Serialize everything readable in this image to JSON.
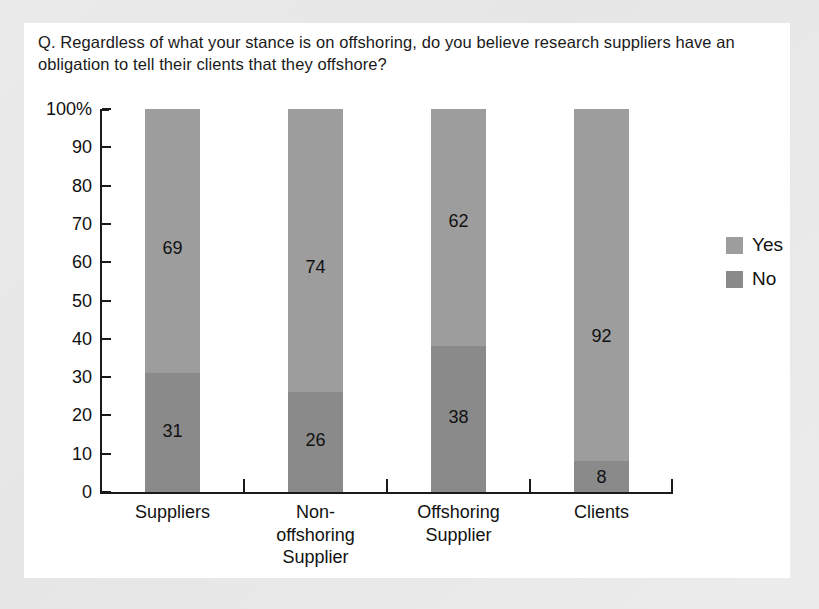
{
  "card": {
    "question": "Q. Regardless of what your stance is on offshoring, do you believe research suppliers have an obligation to tell their clients that they offshore?"
  },
  "legend": {
    "position": "right",
    "items": [
      {
        "label": "Yes",
        "color": "#9d9d9d",
        "swatch_name": "legend-swatch-yes"
      },
      {
        "label": "No",
        "color": "#8a8a8a",
        "swatch_name": "legend-swatch-no"
      }
    ]
  },
  "axis": {
    "y_ticks": [
      "100%",
      "90",
      "80",
      "70",
      "60",
      "50",
      "40",
      "30",
      "20",
      "10",
      "0"
    ],
    "x_categories": [
      "Suppliers",
      "Non-\noffshoring\nSupplier",
      "Offshoring\nSupplier",
      "Clients"
    ]
  },
  "chart_data": {
    "type": "bar",
    "subtype": "stacked-100-percent",
    "title": "Q. Regardless of what your stance is on offshoring, do you believe research suppliers have an obligation to tell their clients that they offshore?",
    "xlabel": "",
    "ylabel": "",
    "ylim": [
      0,
      100
    ],
    "y_tick_values": [
      0,
      10,
      20,
      30,
      40,
      50,
      60,
      70,
      80,
      90,
      100
    ],
    "y_tick_labels": [
      "0",
      "10",
      "20",
      "30",
      "40",
      "50",
      "60",
      "70",
      "80",
      "90",
      "100%"
    ],
    "grid": false,
    "legend_position": "right",
    "categories": [
      "Suppliers",
      "Non-offshoring Supplier",
      "Offshoring Supplier",
      "Clients"
    ],
    "series": [
      {
        "name": "Yes",
        "color": "#9d9d9d",
        "values": [
          69,
          74,
          62,
          92
        ]
      },
      {
        "name": "No",
        "color": "#8a8a8a",
        "values": [
          31,
          26,
          38,
          8
        ]
      }
    ],
    "data_labels": {
      "Yes": [
        "69",
        "74",
        "62",
        "92"
      ],
      "No": [
        "31",
        "26",
        "38",
        "8"
      ]
    }
  },
  "bars": [
    {
      "category": "Suppliers",
      "category_lines": [
        "Suppliers"
      ],
      "yes": 69,
      "no": 31,
      "yes_label": "69",
      "no_label": "31"
    },
    {
      "category": "Non-offshoring Supplier",
      "category_lines": [
        "Non-",
        "offshoring",
        "Supplier"
      ],
      "yes": 74,
      "no": 26,
      "yes_label": "74",
      "no_label": "26"
    },
    {
      "category": "Offshoring Supplier",
      "category_lines": [
        "Offshoring",
        "Supplier"
      ],
      "yes": 62,
      "no": 38,
      "yes_label": "62",
      "no_label": "38"
    },
    {
      "category": "Clients",
      "category_lines": [
        "Clients"
      ],
      "yes": 92,
      "no": 8,
      "yes_label": "92",
      "no_label": "8"
    }
  ]
}
